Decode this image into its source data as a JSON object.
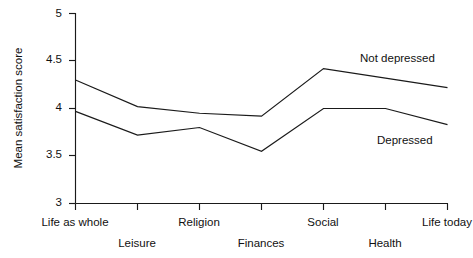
{
  "chart_data": {
    "type": "line",
    "title": "",
    "xlabel": "",
    "ylabel": "Mean satisfaction score",
    "ylim": [
      3,
      5
    ],
    "yticks": [
      3,
      3.5,
      4,
      4.5,
      5
    ],
    "ytick_labels": [
      "3",
      "3.5",
      "4",
      "4.5",
      "5"
    ],
    "grid": false,
    "legend_position": "inline-right",
    "categories": [
      "Life as whole",
      "Leisure",
      "Religion",
      "Finances",
      "Social",
      "Health",
      "Life today"
    ],
    "series": [
      {
        "name": "Not depressed",
        "label": "Not depressed",
        "values": [
          4.3,
          4.02,
          3.95,
          3.92,
          4.42,
          4.32,
          4.22
        ]
      },
      {
        "name": "Depressed",
        "label": "Depressed",
        "values": [
          3.97,
          3.72,
          3.8,
          3.55,
          4.0,
          4.0,
          3.83
        ]
      }
    ]
  },
  "axis": {
    "y_title": "Mean satisfaction score",
    "y_labels": [
      "5",
      "4.5",
      "4",
      "3.5",
      "3"
    ],
    "x_labels_row_top": [
      "Life as whole",
      "Religion",
      "Social",
      "Life today"
    ],
    "x_labels_row_bottom": [
      "Leisure",
      "Finances",
      "Health"
    ]
  },
  "annotations": {
    "not_depressed": "Not depressed",
    "depressed": "Depressed"
  },
  "colors": {
    "ink": "#1a1a1a",
    "background": "#ffffff"
  }
}
